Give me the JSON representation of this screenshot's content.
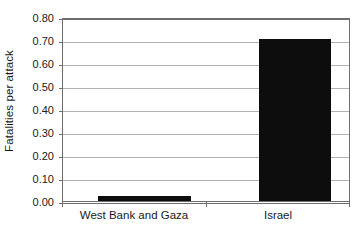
{
  "chart_data": {
    "type": "bar",
    "title": "",
    "xlabel": "",
    "ylabel": "Fatalities per attack",
    "categories": [
      "West Bank and Gaza",
      "Israel"
    ],
    "values": [
      0.02,
      0.705
    ],
    "ylim": [
      0.0,
      0.8
    ],
    "ytick_step": 0.1,
    "ytick_labels": [
      "0.00",
      "0.10",
      "0.20",
      "0.30",
      "0.40",
      "0.50",
      "0.60",
      "0.70",
      "0.80"
    ],
    "ytick_values": [
      0.0,
      0.1,
      0.2,
      0.3,
      0.4,
      0.5,
      0.6,
      0.7,
      0.8
    ],
    "grid": true,
    "legend": false,
    "bar_color": "#0d0d0d",
    "gridline_color": "#b2b2b2",
    "frame_color": "#6e6e6e",
    "background_color": "#ffffff"
  }
}
